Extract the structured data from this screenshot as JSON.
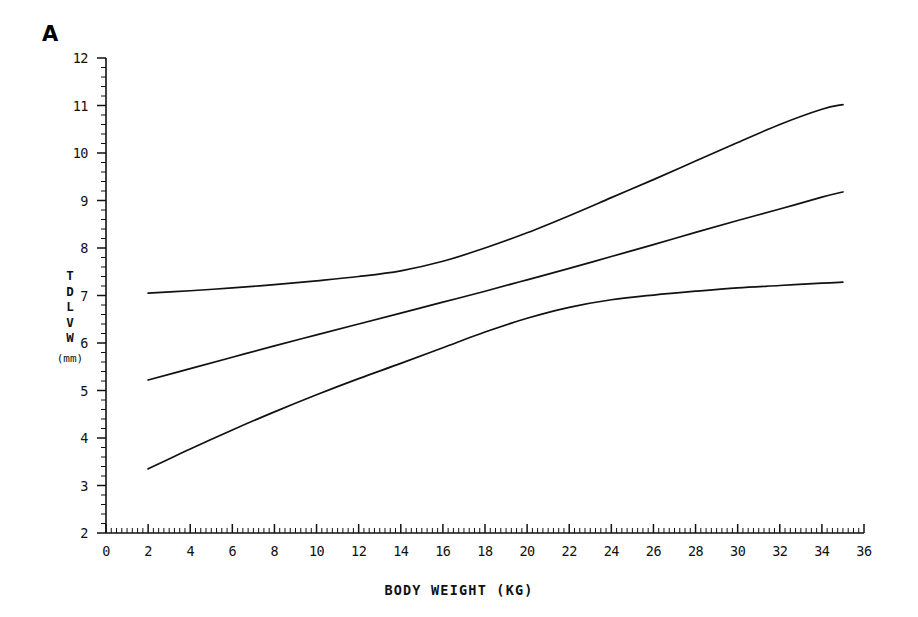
{
  "panel": {
    "label": "A"
  },
  "axes": {
    "y": {
      "title_chars": [
        "T",
        "D",
        "L",
        "V",
        "W"
      ],
      "unit": "(mm)",
      "ticks": [
        "12",
        "11",
        "10",
        "9",
        "8",
        "7",
        "6",
        "5",
        "4",
        "3",
        "2"
      ],
      "min": 2,
      "max": 12,
      "minor_step": 0.2
    },
    "x": {
      "title": "BODY WEIGHT (KG)",
      "ticks": [
        "0",
        "2",
        "4",
        "6",
        "8",
        "10",
        "12",
        "14",
        "16",
        "18",
        "20",
        "22",
        "24",
        "26",
        "28",
        "30",
        "32",
        "34",
        "36"
      ],
      "min": 0,
      "max": 36,
      "minor_step": 0.25
    }
  },
  "style": {
    "axis_color": "#111111",
    "line_color": "#111111",
    "background": "#ffffff"
  },
  "chart_data": {
    "type": "line",
    "title": "A",
    "xlabel": "BODY WEIGHT (KG)",
    "ylabel": "TDLVW (mm)",
    "xlim": [
      0,
      36
    ],
    "ylim": [
      2,
      12
    ],
    "grid": false,
    "legend": "none",
    "x": [
      2,
      4,
      6,
      8,
      10,
      12,
      14,
      16,
      18,
      20,
      22,
      24,
      26,
      28,
      30,
      32,
      34,
      35
    ],
    "series": [
      {
        "name": "upper",
        "values": [
          7.05,
          7.1,
          7.16,
          7.23,
          7.31,
          7.4,
          7.52,
          7.72,
          8.0,
          8.32,
          8.68,
          9.06,
          9.44,
          9.83,
          10.22,
          10.6,
          10.92,
          11.02
        ]
      },
      {
        "name": "mean",
        "values": [
          5.22,
          5.46,
          5.7,
          5.94,
          6.17,
          6.4,
          6.63,
          6.86,
          7.09,
          7.33,
          7.57,
          7.82,
          8.07,
          8.33,
          8.58,
          8.82,
          9.07,
          9.18
        ]
      },
      {
        "name": "lower",
        "values": [
          3.35,
          3.77,
          4.17,
          4.55,
          4.91,
          5.25,
          5.57,
          5.9,
          6.23,
          6.52,
          6.75,
          6.91,
          7.01,
          7.09,
          7.16,
          7.21,
          7.26,
          7.28
        ]
      }
    ]
  }
}
